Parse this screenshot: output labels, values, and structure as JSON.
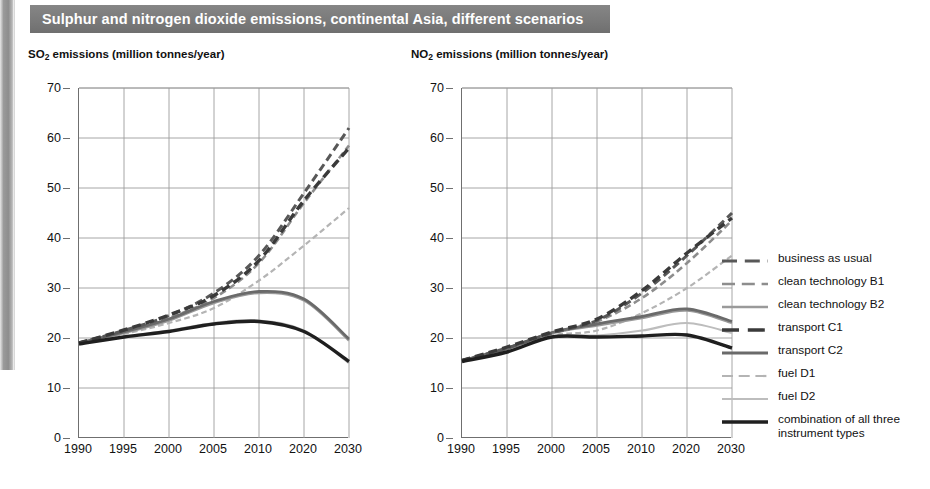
{
  "banner": {
    "title": "Sulphur and nitrogen dioxide emissions, continental Asia, different scenarios"
  },
  "panels": {
    "so2": {
      "title_main": "SO",
      "title_sub": "2",
      "title_rest": " emissions (million tonnes/year)"
    },
    "no2": {
      "title_main": "NO",
      "title_sub": "2",
      "title_rest": " emissions (million tonnes/year)"
    }
  },
  "axes": {
    "ylabels": [
      "70",
      "60",
      "50",
      "40",
      "30",
      "20",
      "10",
      "0"
    ],
    "xlabels": [
      "1990",
      "1995",
      "2000",
      "2005",
      "2010",
      "2020",
      "2030"
    ]
  },
  "legend": {
    "items": [
      {
        "label": "business as usual",
        "style": "dashed",
        "color": "#585858",
        "width": 3.0
      },
      {
        "label": "clean technology B1",
        "style": "dashed",
        "color": "#8d8d8d",
        "width": 2.6
      },
      {
        "label": "clean technology B2",
        "style": "solid",
        "color": "#9a9a9a",
        "width": 2.4
      },
      {
        "label": "transport C1",
        "style": "dashed",
        "color": "#3a3a3a",
        "width": 3.4
      },
      {
        "label": "transport C2",
        "style": "solid",
        "color": "#6a6a6a",
        "width": 2.8
      },
      {
        "label": "fuel D1",
        "style": "dashed",
        "color": "#b4b4b4",
        "width": 2.2
      },
      {
        "label": "fuel D2",
        "style": "solid",
        "color": "#bdbdbd",
        "width": 2.2
      },
      {
        "label": "combination of all three\ninstrument types",
        "style": "solid",
        "color": "#1f1f1f",
        "width": 3.4
      }
    ]
  },
  "chart_data": [
    {
      "type": "line",
      "title": "SO2 emissions (million tonnes/year)",
      "xlabel": "",
      "ylabel": "SO2 emissions (million tonnes/year)",
      "x": [
        "1990",
        "1995",
        "2000",
        "2005",
        "2010",
        "2020",
        "2030"
      ],
      "ylim": [
        0,
        70
      ],
      "yticks": [
        0,
        10,
        20,
        30,
        40,
        50,
        60,
        70
      ],
      "grid": true,
      "legend_position": "right-outside",
      "series": [
        {
          "name": "business as usual",
          "style": "dashed",
          "color": "#585858",
          "width": 3.0,
          "values": [
            19.0,
            21.5,
            24.5,
            29.0,
            36.5,
            49.0,
            62.0
          ]
        },
        {
          "name": "clean technology B1",
          "style": "dashed",
          "color": "#8d8d8d",
          "width": 2.6,
          "values": [
            19.0,
            21.3,
            24.0,
            28.0,
            35.0,
            47.0,
            58.5
          ]
        },
        {
          "name": "clean technology B2",
          "style": "solid",
          "color": "#9a9a9a",
          "width": 2.4,
          "values": [
            19.0,
            21.0,
            23.5,
            27.0,
            29.0,
            27.5,
            19.5
          ]
        },
        {
          "name": "transport C1",
          "style": "dashed",
          "color": "#3a3a3a",
          "width": 3.4,
          "values": [
            19.0,
            21.6,
            24.6,
            28.5,
            35.5,
            47.5,
            58.0
          ]
        },
        {
          "name": "transport C2",
          "style": "solid",
          "color": "#6a6a6a",
          "width": 2.8,
          "values": [
            19.0,
            21.2,
            23.8,
            27.3,
            29.3,
            27.8,
            19.8
          ]
        },
        {
          "name": "fuel D1",
          "style": "dashed",
          "color": "#b4b4b4",
          "width": 2.2,
          "values": [
            19.0,
            20.8,
            23.0,
            26.0,
            31.5,
            38.5,
            46.0
          ]
        },
        {
          "name": "fuel D2",
          "style": "solid",
          "color": "#bdbdbd",
          "width": 2.2,
          "values": [
            18.8,
            20.3,
            21.5,
            23.0,
            23.5,
            21.5,
            15.0
          ]
        },
        {
          "name": "combination of all three instrument types",
          "style": "solid",
          "color": "#1f1f1f",
          "width": 3.4,
          "values": [
            18.8,
            20.2,
            21.3,
            22.8,
            23.3,
            21.3,
            15.3
          ]
        }
      ]
    },
    {
      "type": "line",
      "title": "NO2 emissions (million tonnes/year)",
      "xlabel": "",
      "ylabel": "NO2 emissions (million tonnes/year)",
      "x": [
        "1990",
        "1995",
        "2000",
        "2005",
        "2010",
        "2020",
        "2030"
      ],
      "ylim": [
        0,
        70
      ],
      "yticks": [
        0,
        10,
        20,
        30,
        40,
        50,
        60,
        70
      ],
      "grid": true,
      "legend_position": "right-outside",
      "series": [
        {
          "name": "business as usual",
          "style": "dashed",
          "color": "#585858",
          "width": 3.0,
          "values": [
            15.5,
            18.0,
            21.0,
            23.5,
            29.0,
            36.5,
            45.0
          ]
        },
        {
          "name": "clean technology B1",
          "style": "dashed",
          "color": "#8d8d8d",
          "width": 2.6,
          "values": [
            15.5,
            18.0,
            21.0,
            23.3,
            28.0,
            35.0,
            43.5
          ]
        },
        {
          "name": "clean technology B2",
          "style": "solid",
          "color": "#9a9a9a",
          "width": 2.4,
          "values": [
            15.5,
            17.8,
            21.0,
            22.5,
            24.0,
            25.5,
            23.0
          ]
        },
        {
          "name": "transport C1",
          "style": "dashed",
          "color": "#3a3a3a",
          "width": 3.4,
          "values": [
            15.5,
            18.2,
            21.2,
            23.8,
            29.5,
            37.0,
            44.0
          ]
        },
        {
          "name": "transport C2",
          "style": "solid",
          "color": "#6a6a6a",
          "width": 2.8,
          "values": [
            15.5,
            17.9,
            21.1,
            22.8,
            24.3,
            25.8,
            23.3
          ]
        },
        {
          "name": "fuel D1",
          "style": "dashed",
          "color": "#b4b4b4",
          "width": 2.2,
          "values": [
            15.5,
            17.5,
            20.5,
            21.5,
            25.0,
            30.0,
            36.5
          ]
        },
        {
          "name": "fuel D2",
          "style": "solid",
          "color": "#bdbdbd",
          "width": 2.2,
          "values": [
            15.3,
            17.3,
            20.3,
            20.5,
            21.5,
            23.0,
            21.0
          ]
        },
        {
          "name": "combination of all three instrument types",
          "style": "solid",
          "color": "#1f1f1f",
          "width": 3.4,
          "values": [
            15.3,
            17.2,
            20.2,
            20.2,
            20.4,
            20.6,
            18.0
          ]
        }
      ]
    }
  ]
}
